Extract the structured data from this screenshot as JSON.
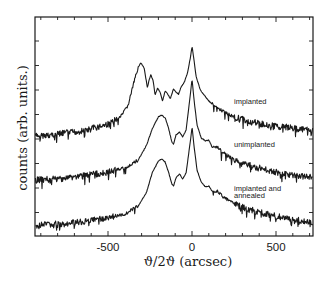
{
  "chart_data": {
    "type": "line",
    "title": "",
    "xlabel": "ϑ/2ϑ (arcsec)",
    "ylabel": "counts (arb. units.)",
    "xlim": [
      -935,
      720
    ],
    "x_ticks": [
      -500,
      0,
      500
    ],
    "x_tick_labels": [
      "-500",
      "0",
      "500"
    ],
    "y_tick_labels_shown": false,
    "grid": false,
    "legend": "inline labels",
    "series": [
      {
        "name": "implanted",
        "label": "implanted",
        "points": [
          [
            -935,
            136
          ],
          [
            -800,
            134
          ],
          [
            -650,
            131
          ],
          [
            -500,
            124
          ],
          [
            -420,
            116
          ],
          [
            -380,
            105
          ],
          [
            -350,
            85
          ],
          [
            -320,
            67
          ],
          [
            -305,
            63
          ],
          [
            -285,
            68
          ],
          [
            -265,
            88
          ],
          [
            -255,
            80
          ],
          [
            -245,
            75
          ],
          [
            -232,
            80
          ],
          [
            -220,
            95
          ],
          [
            -205,
            88
          ],
          [
            -190,
            92
          ],
          [
            -175,
            101
          ],
          [
            -160,
            91
          ],
          [
            -145,
            94
          ],
          [
            -130,
            99
          ],
          [
            -110,
            89
          ],
          [
            -95,
            92
          ],
          [
            -80,
            94
          ],
          [
            -65,
            87
          ],
          [
            -45,
            82
          ],
          [
            -25,
            72
          ],
          [
            -10,
            58
          ],
          [
            0,
            46
          ],
          [
            10,
            58
          ],
          [
            25,
            77
          ],
          [
            50,
            90
          ],
          [
            100,
            101
          ],
          [
            150,
            108
          ],
          [
            250,
            117
          ],
          [
            350,
            122
          ],
          [
            450,
            125
          ],
          [
            550,
            127
          ],
          [
            720,
            131
          ]
        ]
      },
      {
        "name": "unimplanted",
        "label": "unimplanted",
        "points": [
          [
            -935,
            180
          ],
          [
            -800,
            179
          ],
          [
            -650,
            176
          ],
          [
            -500,
            172
          ],
          [
            -400,
            168
          ],
          [
            -320,
            160
          ],
          [
            -270,
            145
          ],
          [
            -235,
            128
          ],
          [
            -200,
            117
          ],
          [
            -180,
            115
          ],
          [
            -160,
            118
          ],
          [
            -140,
            128
          ],
          [
            -120,
            142
          ],
          [
            -110,
            144
          ],
          [
            -95,
            135
          ],
          [
            -75,
            132
          ],
          [
            -55,
            137
          ],
          [
            -35,
            130
          ],
          [
            -15,
            102
          ],
          [
            0,
            79
          ],
          [
            12,
            100
          ],
          [
            30,
            125
          ],
          [
            55,
            138
          ],
          [
            80,
            141
          ],
          [
            100,
            140
          ],
          [
            120,
            147
          ],
          [
            150,
            147
          ],
          [
            180,
            152
          ],
          [
            250,
            160
          ],
          [
            350,
            166
          ],
          [
            450,
            170
          ],
          [
            550,
            174
          ],
          [
            720,
            177
          ]
        ]
      },
      {
        "name": "implanted and annealed",
        "label": "implanted and annealed",
        "points": [
          [
            -935,
            225
          ],
          [
            -800,
            224
          ],
          [
            -650,
            222
          ],
          [
            -500,
            218
          ],
          [
            -400,
            214
          ],
          [
            -320,
            206
          ],
          [
            -270,
            192
          ],
          [
            -235,
            172
          ],
          [
            -200,
            161
          ],
          [
            -180,
            159
          ],
          [
            -160,
            162
          ],
          [
            -140,
            172
          ],
          [
            -120,
            184
          ],
          [
            -110,
            186
          ],
          [
            -95,
            178
          ],
          [
            -75,
            174
          ],
          [
            -55,
            179
          ],
          [
            -35,
            173
          ],
          [
            -15,
            148
          ],
          [
            0,
            127
          ],
          [
            12,
            146
          ],
          [
            30,
            170
          ],
          [
            55,
            182
          ],
          [
            80,
            187
          ],
          [
            100,
            186
          ],
          [
            120,
            191
          ],
          [
            150,
            191
          ],
          [
            180,
            196
          ],
          [
            250,
            204
          ],
          [
            350,
            210
          ],
          [
            450,
            214
          ],
          [
            550,
            218
          ],
          [
            720,
            222
          ]
        ]
      }
    ]
  },
  "axes": {
    "xlabel": "ϑ/2ϑ (arcsec)",
    "ylabel": "counts (arb. units.)",
    "x_tick_labels": [
      "-500",
      "0",
      "500"
    ]
  },
  "labels": {
    "implanted": "implanted",
    "unimplanted": "unimplanted",
    "annealed_line1": "implanted and",
    "annealed_line2": "annealed"
  }
}
